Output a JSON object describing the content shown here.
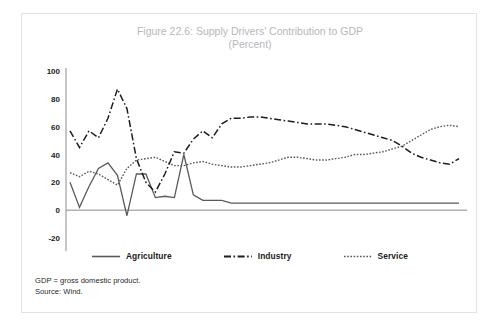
{
  "figure": {
    "title_line1": "Figure 22.6: Supply Drivers' Contribution to GDP",
    "title_line2": "(Percent)"
  },
  "footnotes": {
    "definition": "GDP = gross domestic product.",
    "source": "Source: Wind."
  },
  "legend": {
    "position": "bottom",
    "items": [
      {
        "label": "Agriculture",
        "style": "solid",
        "color": "#5a5a5a",
        "key": "agriculture"
      },
      {
        "label": "Industry",
        "style": "dash-dot",
        "color": "#1d1d1d",
        "key": "industry"
      },
      {
        "label": "Service",
        "style": "dotted",
        "color": "#58585c",
        "key": "service"
      }
    ]
  },
  "chart_data": {
    "type": "line",
    "title": "Figure 22.6: Supply Drivers' Contribution to GDP (Percent)",
    "xlabel": "",
    "ylabel": "",
    "ylim": [
      -20,
      100
    ],
    "yticks": [
      -20,
      0,
      20,
      40,
      60,
      80,
      100
    ],
    "xlim": [
      1979,
      2020
    ],
    "xticks": [
      1979,
      1983,
      1987,
      1991,
      1995,
      1999,
      2003,
      2007,
      2011,
      2015,
      2019
    ],
    "grid": false,
    "x": [
      1979,
      1980,
      1981,
      1982,
      1983,
      1984,
      1985,
      1986,
      1987,
      1988,
      1989,
      1990,
      1991,
      1992,
      1993,
      1994,
      1995,
      1996,
      1997,
      1998,
      1999,
      2000,
      2001,
      2002,
      2003,
      2004,
      2005,
      2006,
      2007,
      2008,
      2009,
      2010,
      2011,
      2012,
      2013,
      2014,
      2015,
      2016,
      2017,
      2018,
      2019,
      2020
    ],
    "series": [
      {
        "name": "Agriculture",
        "values": [
          20,
          2,
          17,
          30,
          34,
          25,
          -4,
          26,
          26,
          9,
          10,
          9,
          40,
          11,
          7,
          7,
          7,
          5,
          5,
          5,
          5,
          5,
          5,
          5,
          5,
          5,
          5,
          5,
          5,
          5,
          5,
          5,
          5,
          5,
          5,
          5,
          5,
          5,
          5,
          5,
          5,
          5
        ]
      },
      {
        "name": "Industry",
        "values": [
          57,
          45,
          57,
          52,
          66,
          87,
          73,
          37,
          20,
          13,
          26,
          42,
          41,
          51,
          57,
          52,
          62,
          66,
          66,
          67,
          67,
          66,
          65,
          64,
          63,
          62,
          62,
          62,
          61,
          60,
          58,
          56,
          54,
          52,
          50,
          46,
          41,
          38,
          36,
          34,
          33,
          37
        ]
      },
      {
        "name": "Service",
        "values": [
          27,
          24,
          28,
          26,
          22,
          18,
          30,
          36,
          37,
          38,
          35,
          32,
          32,
          34,
          35,
          33,
          32,
          31,
          31,
          32,
          33,
          34,
          36,
          38,
          38,
          37,
          36,
          36,
          37,
          38,
          40,
          40,
          41,
          42,
          44,
          46,
          50,
          54,
          58,
          60,
          61,
          60
        ]
      }
    ]
  },
  "axes": {
    "y_labels": [
      "100",
      "80",
      "60",
      "40",
      "20",
      "0",
      "-20"
    ],
    "x_labels": [
      "1979",
      "1983",
      "1987",
      "1991",
      "1995",
      "1999",
      "2003",
      "2007",
      "2011",
      "2015",
      "2019"
    ]
  }
}
